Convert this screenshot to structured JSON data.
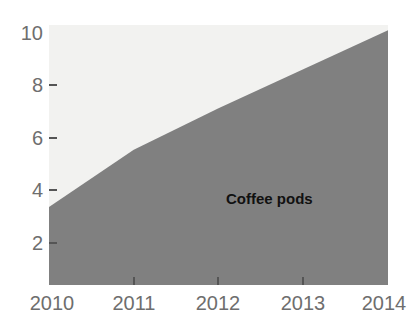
{
  "chart_data": {
    "type": "area",
    "title": "",
    "subtitle": "",
    "xlabel": "",
    "ylabel": "",
    "x": [
      2010,
      2011,
      2012,
      2013,
      2014
    ],
    "categories": [
      "2010",
      "2011",
      "2012",
      "2013",
      "2014"
    ],
    "series": [
      {
        "name": "Coffee pods",
        "values": [
          3.0,
          5.2,
          6.8,
          8.3,
          9.8
        ],
        "color": "#808080"
      }
    ],
    "background_region": {
      "name": "upper-area",
      "color": "#f2f2f0"
    },
    "xlim": [
      2010,
      2014
    ],
    "ylim": [
      0,
      10
    ],
    "y_ticks": [
      2,
      4,
      6,
      8,
      10
    ],
    "y_tick_labels": [
      "2",
      "4",
      "6",
      "8",
      "10"
    ],
    "x_ticks": [
      2010,
      2011,
      2012,
      2013,
      2014
    ],
    "x_tick_labels": [
      "2010",
      "2011",
      "2012",
      "2013",
      "2014"
    ],
    "grid": false,
    "legend": "none",
    "annotations": [
      {
        "text": "Coffee pods",
        "x": 2012.6,
        "y": 3.1
      }
    ]
  },
  "axis": {
    "y": {
      "label_0": "10",
      "label_1": "8",
      "label_2": "6",
      "label_3": "4",
      "label_4": "2"
    },
    "x": {
      "label_0": "2010",
      "label_1": "2011",
      "label_2": "2012",
      "label_3": "2013",
      "label_4": "2014"
    }
  },
  "annotation": {
    "series_label": "Coffee pods"
  },
  "colors": {
    "series_fill": "#808080",
    "plot_background": "#f2f2f0",
    "tick_text": "#6e6e6e",
    "annotation_text": "#111111",
    "page_background": "#ffffff"
  }
}
